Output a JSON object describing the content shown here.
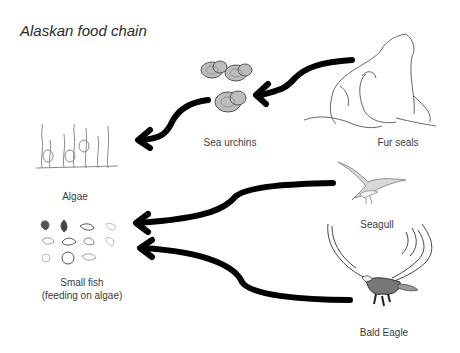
{
  "title": "Alaskan food chain",
  "nodes": {
    "fur_seals": {
      "label": "Fur seals"
    },
    "sea_urchins": {
      "label": "Sea urchins"
    },
    "algae": {
      "label": "Algae"
    },
    "seagull": {
      "label": "Seagull"
    },
    "small_fish": {
      "label_line1": "Small fish",
      "label_line2": "(feeding on algae)"
    },
    "bald_eagle": {
      "label": "Bald Eagle"
    }
  },
  "edges": [
    {
      "from": "Fur seals",
      "to": "Sea urchins"
    },
    {
      "from": "Sea urchins",
      "to": "Algae"
    },
    {
      "from": "Seagull",
      "to": "Small fish"
    },
    {
      "from": "Bald Eagle",
      "to": "Small fish"
    }
  ],
  "colors": {
    "arrow": "#000000",
    "text": "#3c3c3c",
    "background": "#ffffff"
  }
}
